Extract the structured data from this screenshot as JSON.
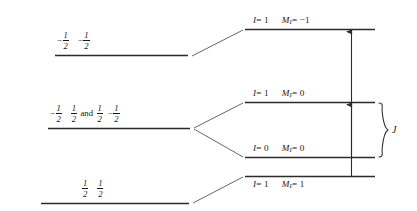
{
  "figure": {
    "line_color": "#2b2b2b",
    "text_color": "#1a1a1a",
    "background": "#ffffff"
  },
  "left_levels": [
    {
      "id": "left-level-top",
      "label_plain": "-1/2 -1/2",
      "terms": [
        {
          "sign": "−",
          "num": "1",
          "den": "2"
        },
        {
          "sign": "−",
          "num": "1",
          "den": "2"
        }
      ]
    },
    {
      "id": "left-level-middle",
      "label_plain": "-1/2 1/2 and 1/2 -1/2",
      "terms": [
        {
          "sign": "−",
          "num": "1",
          "den": "2"
        },
        {
          "sign": "",
          "num": "1",
          "den": "2"
        },
        {
          "word": "and"
        },
        {
          "sign": "",
          "num": "1",
          "den": "2"
        },
        {
          "sign": "−",
          "num": "1",
          "den": "2"
        }
      ]
    },
    {
      "id": "left-level-bottom",
      "label_plain": "1/2 1/2",
      "terms": [
        {
          "sign": "",
          "num": "1",
          "den": "2"
        },
        {
          "sign": "",
          "num": "1",
          "den": "2"
        }
      ]
    }
  ],
  "right_levels": [
    {
      "id": "right-level-1",
      "I_symbol": "I",
      "I_value": "= 1",
      "M_symbol": "M",
      "M_subscript": "I",
      "M_value": "= −1",
      "label_plain": "I = 1   M_I = -1"
    },
    {
      "id": "right-level-2",
      "I_symbol": "I",
      "I_value": "= 1",
      "M_symbol": "M",
      "M_subscript": "I",
      "M_value": "= 0",
      "label_plain": "I = 1   M_I = 0"
    },
    {
      "id": "right-level-3",
      "I_symbol": "I",
      "I_value": "= 0",
      "M_symbol": "M",
      "M_subscript": "I",
      "M_value": "= 0",
      "label_plain": "I = 0   M_I = 0"
    },
    {
      "id": "right-level-4",
      "I_symbol": "I",
      "I_value": "= 1",
      "M_symbol": "M",
      "M_subscript": "I",
      "M_value": "= 1",
      "label_plain": "I = 1   M_I = 1"
    }
  ],
  "brace": {
    "label": "J",
    "meaning": "coupling-constant-J"
  },
  "arrows": [
    {
      "id": "transition-arrow-upper",
      "direction": "up"
    },
    {
      "id": "transition-arrow-lower",
      "direction": "up"
    }
  ]
}
